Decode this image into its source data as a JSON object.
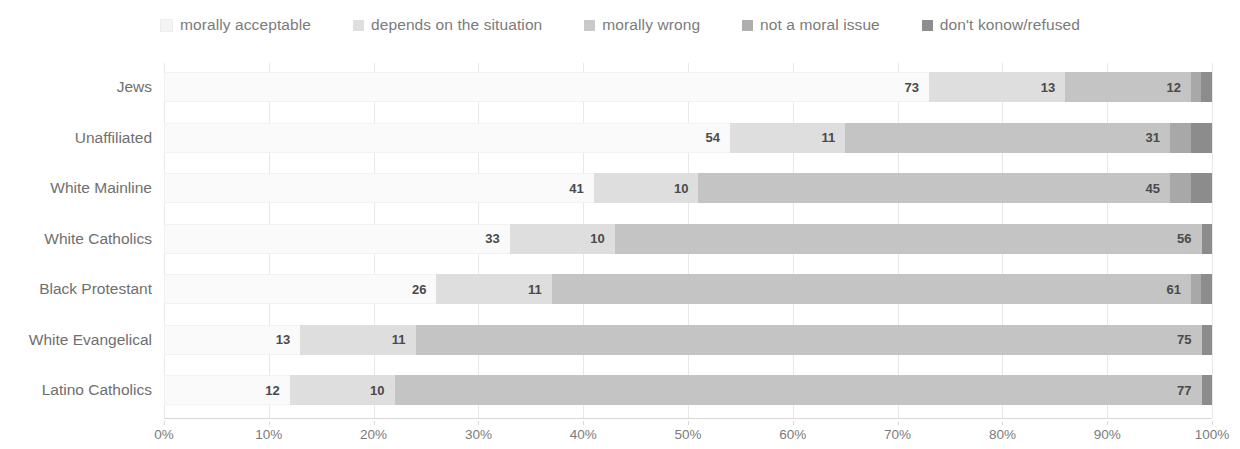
{
  "chart_data": {
    "type": "bar",
    "orientation": "horizontal",
    "stacked": true,
    "stack_mode": "percent",
    "title": "",
    "subtitle": "",
    "xlabel": "",
    "ylabel": "",
    "xlim": [
      0,
      100
    ],
    "xticks": [
      0,
      10,
      20,
      30,
      40,
      50,
      60,
      70,
      80,
      90,
      100
    ],
    "xtick_labels": [
      "0%",
      "10%",
      "20%",
      "30%",
      "40%",
      "50%",
      "60%",
      "70%",
      "80%",
      "90%",
      "100%"
    ],
    "grid": true,
    "grid_axis": "x",
    "legend_position": "top",
    "categories": [
      "Jews",
      "Unaffiliated",
      "White Mainline",
      "White Catholics",
      "Black Protestant",
      "White Evangelical",
      "Latino Catholics"
    ],
    "series": [
      {
        "name": "morally acceptable",
        "color": "#fafafa",
        "values": [
          73,
          54,
          41,
          33,
          26,
          13,
          12
        ],
        "labels": [
          "73",
          "54",
          "41",
          "33",
          "26",
          "13",
          "12"
        ]
      },
      {
        "name": "depends on the situation",
        "color": "#dedede",
        "values": [
          13,
          11,
          10,
          10,
          11,
          11,
          10
        ],
        "labels": [
          "13",
          "11",
          "10",
          "10",
          "11",
          "11",
          "10"
        ]
      },
      {
        "name": "morally wrong",
        "color": "#c4c4c4",
        "values": [
          12,
          31,
          45,
          56,
          61,
          75,
          77
        ],
        "labels": [
          "12",
          "31",
          "45",
          "56",
          "61",
          "75",
          "77"
        ]
      },
      {
        "name": "not a moral issue",
        "color": "#a8a8a8",
        "values": [
          1,
          2,
          2,
          0,
          1,
          0,
          0
        ],
        "labels": [
          "",
          "",
          "",
          "",
          "",
          "",
          ""
        ]
      },
      {
        "name": "don't konow/refused",
        "color": "#8c8c8c",
        "values": [
          1,
          2,
          2,
          1,
          1,
          1,
          1
        ],
        "labels": [
          "",
          "",
          "",
          "",
          "",
          "",
          ""
        ]
      }
    ]
  },
  "legend": {
    "items": [
      {
        "label": "morally acceptable",
        "color": "#f4f4f4",
        "icon": "legend-swatch-icon"
      },
      {
        "label": "depends on the situation",
        "color": "#dedede",
        "icon": "legend-swatch-icon"
      },
      {
        "label": "morally wrong",
        "color": "#c9c9c9",
        "icon": "legend-swatch-icon"
      },
      {
        "label": "not a moral issue",
        "color": "#aeaeae",
        "icon": "legend-swatch-icon"
      },
      {
        "label": "don't konow/refused",
        "color": "#8e8e8e",
        "icon": "legend-swatch-icon"
      }
    ]
  }
}
